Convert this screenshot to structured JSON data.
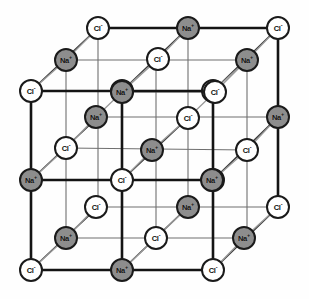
{
  "figure": {
    "width": 309,
    "height": 299,
    "background_color": "#fefefe"
  },
  "ion_types": {
    "chloride": {
      "label": "Cl",
      "charge": "-",
      "fill_color": "#ffffff",
      "stroke_color": "#1a1a1a",
      "text_color": "#101010"
    },
    "sodium": {
      "label": "Na",
      "charge": "+",
      "fill_color": "#8d8d8d",
      "stroke_color": "#1a1a1a",
      "text_color": "#111111"
    }
  },
  "bonds": {
    "front_edge_color": "#141414",
    "front_edge_width": 2.6,
    "interior_edge_color": "#6f6f6f",
    "interior_edge_width": 1.1,
    "depth_edge_color": "#3a3a3a",
    "depth_edge_width": 1.6,
    "depth_edge_faint_color": "#9a9a9a"
  },
  "geometry": {
    "front_origin_x": 31,
    "front_origin_y": 270,
    "spacing": 91,
    "depth_dx": 33,
    "depth_dy": -30,
    "layers": 3,
    "rows": 3,
    "cols": 3
  },
  "ions": [
    {
      "type": "chloride",
      "label": "Cl",
      "charge": "-",
      "x": 31,
      "y": 270,
      "layer": 0,
      "row": 0,
      "col": 0
    },
    {
      "type": "sodium",
      "label": "Na",
      "charge": "+",
      "x": 122,
      "y": 270,
      "layer": 0,
      "row": 0,
      "col": 1
    },
    {
      "type": "chloride",
      "label": "Cl",
      "charge": "-",
      "x": 213,
      "y": 270,
      "layer": 0,
      "row": 0,
      "col": 2
    },
    {
      "type": "sodium",
      "label": "Na",
      "charge": "+",
      "x": 31,
      "y": 180,
      "layer": 0,
      "row": 1,
      "col": 0
    },
    {
      "type": "chloride",
      "label": "Cl",
      "charge": "-",
      "x": 122,
      "y": 180,
      "layer": 0,
      "row": 1,
      "col": 1
    },
    {
      "type": "sodium",
      "label": "Na",
      "charge": "+",
      "x": 213,
      "y": 180,
      "layer": 0,
      "row": 1,
      "col": 2
    },
    {
      "type": "chloride",
      "label": "Cl",
      "charge": "-",
      "x": 31,
      "y": 91,
      "layer": 0,
      "row": 2,
      "col": 0
    },
    {
      "type": "sodium",
      "label": "Na",
      "charge": "+",
      "x": 122,
      "y": 91,
      "layer": 0,
      "row": 2,
      "col": 1
    },
    {
      "type": "chloride",
      "label": "Cl",
      "charge": "-",
      "x": 213,
      "y": 91,
      "layer": 0,
      "row": 2,
      "col": 2
    },
    {
      "type": "sodium",
      "label": "Na",
      "charge": "+",
      "x": 66,
      "y": 238,
      "layer": 1,
      "row": 0,
      "col": 0
    },
    {
      "type": "chloride",
      "label": "Cl",
      "charge": "-",
      "x": 156,
      "y": 238,
      "layer": 1,
      "row": 0,
      "col": 1
    },
    {
      "type": "sodium",
      "label": "Na",
      "charge": "+",
      "x": 244,
      "y": 238,
      "layer": 1,
      "row": 0,
      "col": 2
    },
    {
      "type": "chloride",
      "label": "Cl",
      "charge": "-",
      "x": 96,
      "y": 207,
      "layer": 1,
      "row": 1,
      "col": 0
    },
    {
      "type": "sodium",
      "label": "Na",
      "charge": "+",
      "x": 188,
      "y": 207,
      "layer": 1,
      "row": 1,
      "col": 1
    },
    {
      "type": "chloride",
      "label": "Cl",
      "charge": "-",
      "x": 278,
      "y": 207,
      "layer": 1,
      "row": 1,
      "col": 2
    },
    {
      "type": "chloride",
      "label": "Cl",
      "charge": "-",
      "x": 66,
      "y": 148,
      "layer": 1,
      "row": 2,
      "col": 0
    },
    {
      "type": "sodium",
      "label": "Na",
      "charge": "+",
      "x": 152,
      "y": 150,
      "layer": 1,
      "row": 2,
      "col": 1
    },
    {
      "type": "sodium",
      "label": "Na",
      "charge": "+",
      "x": 212,
      "y": 180,
      "layer": 1,
      "row": 2,
      "col": 2
    },
    {
      "type": "sodium",
      "label": "Na",
      "charge": "+",
      "x": 96,
      "y": 117,
      "layer": 2,
      "row": 0,
      "col": 0
    },
    {
      "type": "chloride",
      "label": "Cl",
      "charge": "-",
      "x": 188,
      "y": 118,
      "layer": 2,
      "row": 0,
      "col": 1
    },
    {
      "type": "sodium",
      "label": "Na",
      "charge": "+",
      "x": 278,
      "y": 117,
      "layer": 2,
      "row": 0,
      "col": 2
    },
    {
      "type": "sodium",
      "label": "Na",
      "charge": "+",
      "x": 122,
      "y": 92,
      "layer": 2,
      "row": 1,
      "col": 0
    },
    {
      "type": "chloride",
      "label": "Cl",
      "charge": "-",
      "x": 215,
      "y": 92,
      "layer": 2,
      "row": 1,
      "col": 1
    },
    {
      "type": "sodium",
      "label": "Na",
      "charge": "+",
      "x": 66,
      "y": 60,
      "layer": 2,
      "row": 2,
      "col": 0
    },
    {
      "type": "chloride",
      "label": "Cl",
      "charge": "-",
      "x": 158,
      "y": 59,
      "layer": 2,
      "row": 2,
      "col": 1
    },
    {
      "type": "sodium",
      "label": "Na",
      "charge": "+",
      "x": 247,
      "y": 60,
      "layer": 2,
      "row": 2,
      "col": 2
    },
    {
      "type": "chloride",
      "label": "Cl",
      "charge": "-",
      "x": 98,
      "y": 28,
      "layer": 2,
      "row": 3,
      "col": 0
    },
    {
      "type": "sodium",
      "label": "Na",
      "charge": "+",
      "x": 188,
      "y": 28,
      "layer": 2,
      "row": 3,
      "col": 1
    },
    {
      "type": "chloride",
      "label": "Cl",
      "charge": "-",
      "x": 278,
      "y": 28,
      "layer": 2,
      "row": 3,
      "col": 2
    },
    {
      "type": "chloride",
      "label": "Cl",
      "charge": "-",
      "x": 247,
      "y": 150,
      "layer": 2,
      "row": 4,
      "col": 2
    }
  ],
  "edges": [
    {
      "x1": 31,
      "y1": 270,
      "x2": 213,
      "y2": 270,
      "kind": "front"
    },
    {
      "x1": 31,
      "y1": 180,
      "x2": 213,
      "y2": 180,
      "kind": "front"
    },
    {
      "x1": 31,
      "y1": 91,
      "x2": 213,
      "y2": 91,
      "kind": "front"
    },
    {
      "x1": 31,
      "y1": 91,
      "x2": 31,
      "y2": 270,
      "kind": "front"
    },
    {
      "x1": 122,
      "y1": 91,
      "x2": 122,
      "y2": 270,
      "kind": "front"
    },
    {
      "x1": 213,
      "y1": 91,
      "x2": 213,
      "y2": 270,
      "kind": "front"
    },
    {
      "x1": 66,
      "y1": 238,
      "x2": 244,
      "y2": 238,
      "kind": "interior"
    },
    {
      "x1": 96,
      "y1": 207,
      "x2": 278,
      "y2": 207,
      "kind": "interior"
    },
    {
      "x1": 66,
      "y1": 148,
      "x2": 248,
      "y2": 150,
      "kind": "interior"
    },
    {
      "x1": 66,
      "y1": 60,
      "x2": 248,
      "y2": 60,
      "kind": "interior"
    },
    {
      "x1": 96,
      "y1": 117,
      "x2": 278,
      "y2": 117,
      "kind": "interior"
    },
    {
      "x1": 122,
      "y1": 92,
      "x2": 215,
      "y2": 92,
      "kind": "interior"
    },
    {
      "x1": 98,
      "y1": 28,
      "x2": 278,
      "y2": 28,
      "kind": "front"
    },
    {
      "x1": 98,
      "y1": 28,
      "x2": 98,
      "y2": 207,
      "kind": "interior"
    },
    {
      "x1": 188,
      "y1": 28,
      "x2": 188,
      "y2": 207,
      "kind": "interior"
    },
    {
      "x1": 278,
      "y1": 28,
      "x2": 278,
      "y2": 207,
      "kind": "front"
    },
    {
      "x1": 66,
      "y1": 60,
      "x2": 66,
      "y2": 238,
      "kind": "interior"
    },
    {
      "x1": 156,
      "y1": 60,
      "x2": 156,
      "y2": 238,
      "kind": "interior"
    },
    {
      "x1": 247,
      "y1": 60,
      "x2": 247,
      "y2": 238,
      "kind": "interior"
    },
    {
      "x1": 31,
      "y1": 270,
      "x2": 98,
      "y2": 207,
      "kind": "depth"
    },
    {
      "x1": 122,
      "y1": 270,
      "x2": 188,
      "y2": 207,
      "kind": "depth"
    },
    {
      "x1": 213,
      "y1": 270,
      "x2": 278,
      "y2": 207,
      "kind": "depth"
    },
    {
      "x1": 31,
      "y1": 180,
      "x2": 98,
      "y2": 117,
      "kind": "depth"
    },
    {
      "x1": 122,
      "y1": 180,
      "x2": 188,
      "y2": 118,
      "kind": "depth"
    },
    {
      "x1": 213,
      "y1": 180,
      "x2": 278,
      "y2": 117,
      "kind": "depth"
    },
    {
      "x1": 31,
      "y1": 91,
      "x2": 98,
      "y2": 28,
      "kind": "depth"
    },
    {
      "x1": 122,
      "y1": 91,
      "x2": 188,
      "y2": 28,
      "kind": "depth"
    },
    {
      "x1": 213,
      "y1": 91,
      "x2": 278,
      "y2": 28,
      "kind": "depth"
    }
  ]
}
